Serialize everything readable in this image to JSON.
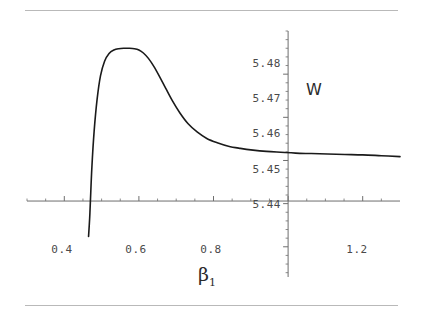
{
  "figure": {
    "background_color": "#ffffff",
    "rule_color": "#b9b9b9",
    "curve_color": "#1a1a1a",
    "axis_color": "#6e6e6e"
  },
  "chart_data": {
    "type": "line",
    "title": "",
    "subtitle": "",
    "xlabel": "β",
    "xlabel_subscript": "1",
    "ylabel": "W",
    "xlim": [
      0.3,
      1.3
    ],
    "ylim": [
      5.433,
      5.49
    ],
    "grid": false,
    "legend": null,
    "x_ticks": [
      0.4,
      0.6,
      0.8,
      1.0,
      1.2
    ],
    "x_tick_labels": [
      "0.4",
      "0.6",
      "0.8",
      "",
      "1.2"
    ],
    "y_ticks": [
      5.44,
      5.45,
      5.46,
      5.47,
      5.48
    ],
    "y_tick_labels": [
      "5.44",
      "5.45",
      "5.46",
      "5.47",
      "5.48"
    ],
    "x_axis_crosses_y_at": 5.4506,
    "y_axis_crosses_x_at": 1.0,
    "minor_ticks": true,
    "annotations": [
      {
        "text": "W",
        "x": 1.06,
        "y": 5.4745
      },
      {
        "text": "β1",
        "x": 0.655,
        "y": 5.4345
      }
    ],
    "series": [
      {
        "name": "W(β1)",
        "color": "#1a1a1a",
        "line_width": 1.6,
        "peak": {
          "x": 0.6,
          "y": 5.486
        },
        "asymptote": 5.4614,
        "x": [
          0.465,
          0.468,
          0.47,
          0.474,
          0.48,
          0.488,
          0.497,
          0.508,
          0.52,
          0.533,
          0.546,
          0.56,
          0.574,
          0.588,
          0.6,
          0.612,
          0.626,
          0.64,
          0.655,
          0.672,
          0.69,
          0.71,
          0.732,
          0.756,
          0.782,
          0.81,
          0.84,
          0.872,
          0.906,
          0.942,
          0.98,
          1.02,
          1.062,
          1.106,
          1.152,
          1.2,
          1.25,
          1.3
        ],
        "y": [
          5.4424,
          5.4466,
          5.4506,
          5.4585,
          5.4668,
          5.4742,
          5.4796,
          5.483,
          5.4848,
          5.4856,
          5.4859,
          5.486,
          5.486,
          5.4859,
          5.4856,
          5.4849,
          5.4836,
          5.4818,
          5.4795,
          5.4767,
          5.4738,
          5.471,
          5.4685,
          5.4666,
          5.4651,
          5.4641,
          5.4633,
          5.4628,
          5.4624,
          5.4621,
          5.4619,
          5.4617,
          5.4616,
          5.4615,
          5.4614,
          5.4613,
          5.4611,
          5.4609
        ]
      }
    ]
  },
  "elements": {
    "top_rule_name": "top-divider-rule",
    "bottom_rule_name": "bottom-divider-rule"
  }
}
